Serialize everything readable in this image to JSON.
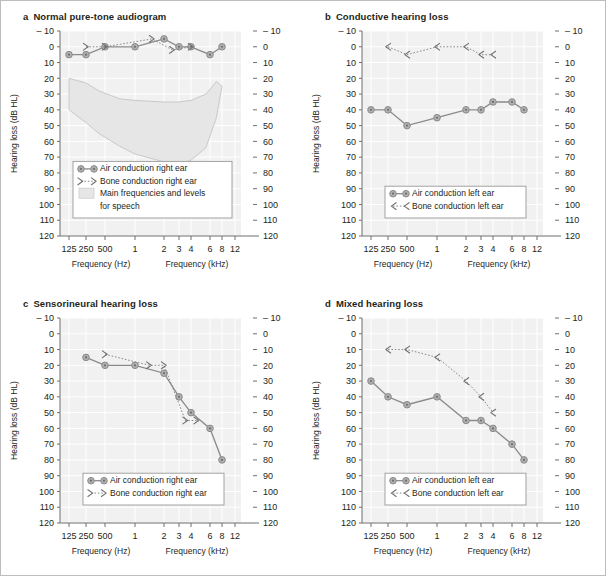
{
  "figure": {
    "accent_color": "#8a8a8a",
    "marker_fill": "#b0b0b0",
    "plot_bg": "#f1f1f1",
    "grid_color": "#ffffff",
    "band_fill": "#e6e6e6"
  },
  "axes": {
    "ylabel": "Hearing loss (dB HL)",
    "xlabel_left": "Frequency (Hz)",
    "xlabel_right": "Frequency (kHz)",
    "yticks": [
      "– 10",
      "0",
      "10",
      "20",
      "30",
      "40",
      "50",
      "60",
      "70",
      "80",
      "90",
      "100",
      "110",
      "120"
    ],
    "yvalues": [
      -10,
      0,
      10,
      20,
      30,
      40,
      50,
      60,
      70,
      80,
      90,
      100,
      110,
      120
    ],
    "ylim": [
      -10,
      120
    ],
    "xticks": [
      "125",
      "250",
      "500",
      "1",
      "2",
      "3",
      "4",
      "6",
      "8",
      "12"
    ],
    "xvalues": [
      125,
      250,
      500,
      1000,
      2000,
      3000,
      4000,
      6000,
      8000,
      12000
    ]
  },
  "panels": [
    {
      "key": "a",
      "label": "a",
      "title": "Normal pure-tone audiogram",
      "legend": [
        {
          "type": "air",
          "text": "Air conduction right ear"
        },
        {
          "type": "bone-right",
          "text": "Bone conduction right ear"
        },
        {
          "type": "band",
          "text": "Main frequencies and levels"
        },
        {
          "type": "band-cont",
          "text": "for speech"
        }
      ],
      "show_band": true,
      "chart_data": {
        "type": "line",
        "title": "Normal pure-tone audiogram",
        "xlabel": "Frequency (Hz / kHz)",
        "ylabel": "Hearing loss (dB HL)",
        "ylim": [
          -10,
          120
        ],
        "series": [
          {
            "name": "Air conduction right ear",
            "marker": "circle",
            "x": [
              125,
              250,
              500,
              1000,
              2000,
              3000,
              4000,
              6000,
              8000
            ],
            "values": [
              5,
              5,
              0,
              0,
              -5,
              0,
              0,
              5,
              0
            ]
          },
          {
            "name": "Bone conduction right ear",
            "marker": "bracket-right",
            "x": [
              250,
              500,
              1500,
              2500,
              4000
            ],
            "values": [
              0,
              0,
              -5,
              2,
              0
            ]
          }
        ]
      }
    },
    {
      "key": "b",
      "label": "b",
      "title": "Conductive hearing loss",
      "legend": [
        {
          "type": "air",
          "text": "Air conduction left ear"
        },
        {
          "type": "bone-left",
          "text": "Bone conduction left ear"
        }
      ],
      "show_band": false,
      "chart_data": {
        "type": "line",
        "title": "Conductive hearing loss",
        "xlabel": "Frequency (Hz / kHz)",
        "ylabel": "Hearing loss (dB HL)",
        "ylim": [
          -10,
          120
        ],
        "series": [
          {
            "name": "Air conduction left ear",
            "marker": "circle",
            "x": [
              125,
              250,
              500,
              1000,
              2000,
              3000,
              4000,
              6000,
              8000
            ],
            "values": [
              40,
              40,
              50,
              45,
              40,
              40,
              35,
              35,
              40
            ]
          },
          {
            "name": "Bone conduction left ear",
            "marker": "bracket-left",
            "x": [
              250,
              500,
              1000,
              2000,
              3000,
              4000
            ],
            "values": [
              0,
              5,
              0,
              0,
              5,
              5
            ]
          }
        ]
      }
    },
    {
      "key": "c",
      "label": "c",
      "title": "Sensorineural hearing loss",
      "legend": [
        {
          "type": "air",
          "text": "Air conduction right ear"
        },
        {
          "type": "bone-right",
          "text": "Bone conduction right ear"
        }
      ],
      "show_band": false,
      "chart_data": {
        "type": "line",
        "title": "Sensorineural hearing loss",
        "xlabel": "Frequency (Hz / kHz)",
        "ylabel": "Hearing loss (dB HL)",
        "ylim": [
          -10,
          120
        ],
        "series": [
          {
            "name": "Air conduction right ear",
            "marker": "circle",
            "x": [
              250,
              500,
              1000,
              2000,
              3000,
              4000,
              6000,
              8000
            ],
            "values": [
              15,
              20,
              20,
              25,
              40,
              50,
              60,
              80
            ]
          },
          {
            "name": "Bone conduction right ear",
            "marker": "bracket-right",
            "x": [
              500,
              1400,
              2000,
              3500,
              4500
            ],
            "values": [
              13,
              20,
              20,
              55,
              55
            ]
          }
        ]
      }
    },
    {
      "key": "d",
      "label": "d",
      "title": "Mixed hearing loss",
      "legend": [
        {
          "type": "air",
          "text": "Air conduction left ear"
        },
        {
          "type": "bone-left",
          "text": "Bone conduction left ear"
        }
      ],
      "show_band": false,
      "chart_data": {
        "type": "line",
        "title": "Mixed hearing loss",
        "xlabel": "Frequency (Hz / kHz)",
        "ylabel": "Hearing loss (dB HL)",
        "ylim": [
          -10,
          120
        ],
        "series": [
          {
            "name": "Air conduction left ear",
            "marker": "circle",
            "x": [
              125,
              250,
              500,
              1000,
              2000,
              3000,
              4000,
              6000,
              8000
            ],
            "values": [
              30,
              40,
              45,
              40,
              55,
              55,
              60,
              70,
              80
            ]
          },
          {
            "name": "Bone conduction left ear",
            "marker": "bracket-left",
            "x": [
              250,
              500,
              1000,
              2000,
              3000,
              4000
            ],
            "values": [
              10,
              10,
              15,
              30,
              40,
              50
            ]
          }
        ]
      }
    }
  ],
  "speech_band": {
    "name": "Main frequencies and levels for speech",
    "upper": [
      [
        125,
        20
      ],
      [
        250,
        23
      ],
      [
        400,
        28
      ],
      [
        700,
        33
      ],
      [
        1000,
        34
      ],
      [
        2000,
        35
      ],
      [
        3000,
        35
      ],
      [
        4000,
        34
      ],
      [
        5500,
        30
      ],
      [
        7000,
        22
      ],
      [
        8000,
        25
      ]
    ],
    "lower": [
      [
        125,
        40
      ],
      [
        250,
        48
      ],
      [
        400,
        55
      ],
      [
        700,
        63
      ],
      [
        1000,
        68
      ],
      [
        2000,
        73
      ],
      [
        3000,
        74
      ],
      [
        4000,
        72
      ],
      [
        5500,
        64
      ],
      [
        7000,
        45
      ],
      [
        8000,
        25
      ]
    ]
  }
}
